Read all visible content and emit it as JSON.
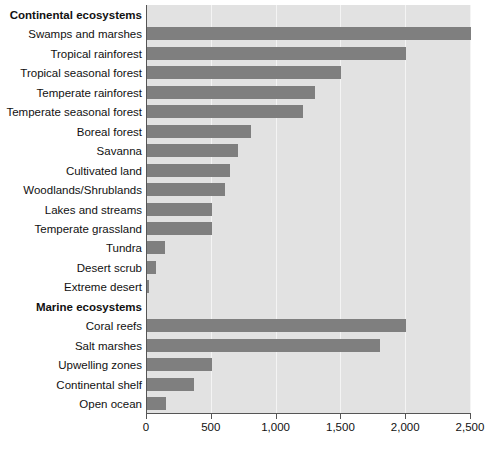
{
  "chart_data": {
    "type": "bar",
    "orientation": "horizontal",
    "title": "",
    "xlabel": "",
    "ylabel": "",
    "xlim": [
      0,
      2500
    ],
    "xticks": [
      0,
      500,
      1000,
      1500,
      2000,
      2500
    ],
    "xtick_labels": [
      "0",
      "500",
      "1,000",
      "1,500",
      "2,000",
      "2,500"
    ],
    "grid": true,
    "legend": "none",
    "bar_color": "#7f7f7f",
    "plot_background": "#e2e2e2",
    "groups": [
      {
        "name": "Continental ecosystems",
        "categories": [
          "Swamps and marshes",
          "Tropical rainforest",
          "Tropical seasonal forest",
          "Temperate rainforest",
          "Temperate seasonal forest",
          "Boreal forest",
          "Savanna",
          "Cultivated land",
          "Woodlands/Shrublands",
          "Lakes and streams",
          "Temperate grassland",
          "Tundra",
          "Desert scrub",
          "Extreme desert"
        ],
        "values": [
          2500,
          2000,
          1500,
          1300,
          1200,
          800,
          700,
          640,
          600,
          500,
          500,
          140,
          70,
          10
        ]
      },
      {
        "name": "Marine ecosystems",
        "categories": [
          "Coral reefs",
          "Salt marshes",
          "Upwelling zones",
          "Continental shelf",
          "Open ocean"
        ],
        "values": [
          2000,
          1800,
          500,
          360,
          150
        ]
      }
    ]
  },
  "rows": [
    {
      "label": "Continental ecosystems",
      "group": true
    },
    {
      "label": "Swamps and marshes",
      "value": 2500
    },
    {
      "label": "Tropical rainforest",
      "value": 2000
    },
    {
      "label": "Tropical seasonal forest",
      "value": 1500
    },
    {
      "label": "Temperate rainforest",
      "value": 1300
    },
    {
      "label": "Temperate seasonal forest",
      "value": 1200
    },
    {
      "label": "Boreal forest",
      "value": 800
    },
    {
      "label": "Savanna",
      "value": 700
    },
    {
      "label": "Cultivated land",
      "value": 640
    },
    {
      "label": "Woodlands/Shrublands",
      "value": 600
    },
    {
      "label": "Lakes and streams",
      "value": 500
    },
    {
      "label": "Temperate grassland",
      "value": 500
    },
    {
      "label": "Tundra",
      "value": 140
    },
    {
      "label": "Desert scrub",
      "value": 70
    },
    {
      "label": "Extreme desert",
      "value": 10
    },
    {
      "label": "Marine ecosystems",
      "group": true
    },
    {
      "label": "Coral reefs",
      "value": 2000
    },
    {
      "label": "Salt marshes",
      "value": 1800
    },
    {
      "label": "Upwelling zones",
      "value": 500
    },
    {
      "label": "Continental shelf",
      "value": 360
    },
    {
      "label": "Open ocean",
      "value": 150
    }
  ]
}
